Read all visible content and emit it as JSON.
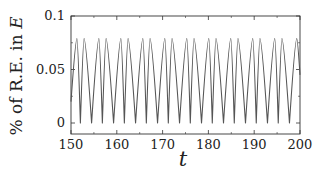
{
  "chart_data": {
    "type": "line",
    "title": "",
    "xlabel": "t",
    "ylabel": "% of R.E. in E",
    "ylabel_parts": {
      "text": "% of R.E. in ",
      "italic": "E"
    },
    "xlim": [
      150,
      200
    ],
    "ylim": [
      -0.007,
      0.1
    ],
    "xticks": [
      150,
      160,
      170,
      180,
      190,
      200
    ],
    "xtick_labels": [
      "150",
      "160",
      "170",
      "180",
      "190",
      "200"
    ],
    "yticks": [
      0,
      0.05,
      0.1
    ],
    "ytick_labels": [
      "0",
      "0.05",
      "0.1"
    ],
    "grid": false,
    "legend": null,
    "line_color": "#555555",
    "series": [
      {
        "name": "R.E. fraction in E",
        "description": "Periodic oscillation with paired peaks (~0.079) and sharp troughs at 0; pair period ~4.8",
        "peak_value": 0.079,
        "trough_value": 0.0,
        "pair_period": 4.8,
        "first_peak_t": 151.3,
        "intra_pair_spacing": 1.55,
        "points": [
          [
            150.0,
            0.02
          ],
          [
            151.3,
            0.079
          ],
          [
            152.05,
            0.0
          ],
          [
            152.85,
            0.079
          ],
          [
            154.5,
            0.0
          ],
          [
            156.1,
            0.079
          ],
          [
            156.85,
            0.0
          ],
          [
            157.65,
            0.079
          ],
          [
            159.3,
            0.0
          ],
          [
            160.9,
            0.079
          ],
          [
            161.65,
            0.0
          ],
          [
            162.45,
            0.079
          ],
          [
            164.1,
            0.0
          ],
          [
            165.7,
            0.079
          ],
          [
            166.45,
            0.0
          ],
          [
            167.25,
            0.079
          ],
          [
            168.9,
            0.0
          ],
          [
            170.5,
            0.079
          ],
          [
            171.25,
            0.0
          ],
          [
            172.05,
            0.079
          ],
          [
            173.7,
            0.0
          ],
          [
            175.3,
            0.079
          ],
          [
            176.05,
            0.0
          ],
          [
            176.85,
            0.079
          ],
          [
            178.5,
            0.0
          ],
          [
            180.1,
            0.079
          ],
          [
            180.85,
            0.0
          ],
          [
            181.65,
            0.079
          ],
          [
            183.3,
            0.0
          ],
          [
            184.9,
            0.079
          ],
          [
            185.65,
            0.0
          ],
          [
            186.45,
            0.079
          ],
          [
            188.1,
            0.0
          ],
          [
            189.7,
            0.079
          ],
          [
            190.45,
            0.0
          ],
          [
            191.25,
            0.079
          ],
          [
            192.9,
            0.0
          ],
          [
            194.5,
            0.079
          ],
          [
            195.25,
            0.0
          ],
          [
            196.05,
            0.079
          ],
          [
            197.7,
            0.0
          ],
          [
            199.3,
            0.079
          ],
          [
            200.0,
            0.045
          ]
        ]
      }
    ]
  }
}
